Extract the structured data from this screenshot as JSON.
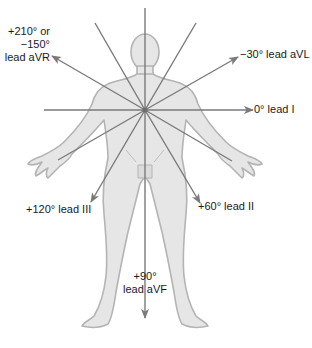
{
  "diagram": {
    "colors": {
      "axis_line": "#7a7a7a",
      "body_fill": "#e6e6e6",
      "body_outline": "#b4b4b4",
      "text": "#1a1a1a"
    },
    "center": {
      "x": 145,
      "y": 110
    },
    "leads": [
      {
        "id": "aVR",
        "angle_text": "+210° or",
        "angle_text2": "−150°",
        "lead_text": "lead aVR"
      },
      {
        "id": "aVL",
        "label": "−30° lead aVL"
      },
      {
        "id": "I",
        "label": "0° lead I"
      },
      {
        "id": "II",
        "label": "+60° lead II"
      },
      {
        "id": "III",
        "label": "+120° lead III"
      },
      {
        "id": "aVF",
        "angle_text": "+90°",
        "lead_text": "lead aVF"
      }
    ]
  }
}
